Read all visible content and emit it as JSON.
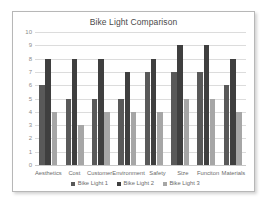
{
  "chart_data": {
    "type": "bar",
    "title": "Bike Light Comparison",
    "xlabel": "",
    "ylabel": "",
    "ylim": [
      0,
      10
    ],
    "yticks": [
      10,
      9,
      8,
      7,
      6,
      5,
      4,
      3,
      2,
      1,
      0
    ],
    "grid": true,
    "legend_position": "bottom",
    "categories": [
      "Aesthetics",
      "Cost",
      "Customer",
      "Environment",
      "Safety",
      "Size",
      "Funciton",
      "Materials"
    ],
    "series": [
      {
        "name": "Bike Light 1",
        "color": "#595959",
        "values": [
          6,
          5,
          5,
          5,
          7,
          7,
          7,
          6
        ]
      },
      {
        "name": "Bike Light 2",
        "color": "#3f3f3f",
        "values": [
          8,
          8,
          8,
          7,
          8,
          9,
          9,
          8
        ]
      },
      {
        "name": "Bike Light 3",
        "color": "#a6a6a6",
        "values": [
          4,
          3,
          4,
          4,
          4,
          5,
          5,
          4
        ]
      }
    ]
  },
  "colors": {
    "frame_border": "#b7b7b7",
    "gridline": "#dcdcdc",
    "axis_text": "#8c8c8c",
    "label_text": "#6b6b6b",
    "title_text": "#4a4a4a",
    "background": "#ffffff"
  }
}
